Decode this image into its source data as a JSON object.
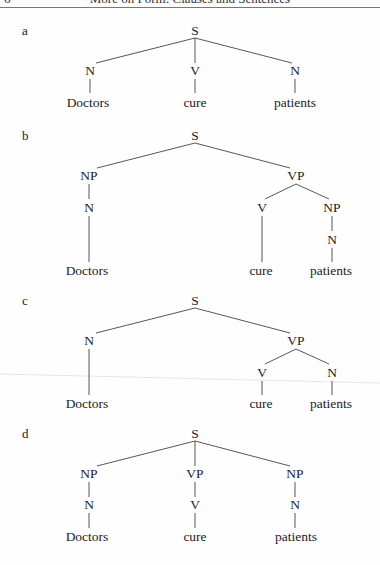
{
  "header": {
    "page_number": "6",
    "running_title": "More on Form: Clauses and Sentences"
  },
  "trees": [
    {
      "label": "a",
      "nodes": {
        "root": "S",
        "n1": "N",
        "n2": "V",
        "n3": "N",
        "w1": "Doctors",
        "w2": "cure",
        "w3": "patients"
      }
    },
    {
      "label": "b",
      "nodes": {
        "root": "S",
        "np1": "NP",
        "n1": "N",
        "vp": "VP",
        "v": "V",
        "np2": "NP",
        "n2": "N",
        "w1": "Doctors",
        "w2": "cure",
        "w3": "patients"
      }
    },
    {
      "label": "c",
      "nodes": {
        "root": "S",
        "n1": "N",
        "vp": "VP",
        "v": "V",
        "n2": "N",
        "w1": "Doctors",
        "w2": "cure",
        "w3": "patients"
      }
    },
    {
      "label": "d",
      "nodes": {
        "root": "S",
        "np1": "NP",
        "vp": "VP",
        "np2": "NP",
        "n1": "N",
        "v": "V",
        "n2": "N",
        "w1": "Doctors",
        "w2": "cure",
        "w3": "patients"
      }
    }
  ]
}
